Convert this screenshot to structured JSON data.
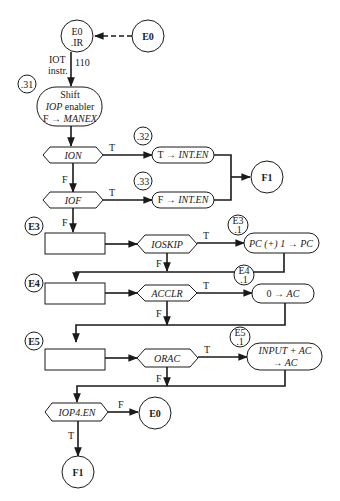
{
  "diagram": {
    "start": {
      "connector_label": "E0",
      "state_line1": "E0",
      "state_line2": ".IR"
    },
    "iot_label": {
      "line1": "IOT",
      "line2": "instr.",
      "code": "110"
    },
    "step31": {
      "tag": ".31",
      "line1": "Shift",
      "line2_italic": "IOP",
      "line2_rest": " enabler",
      "line3_prefix": "F → ",
      "line3_italic": "MANEX"
    },
    "ion": {
      "label": "ION",
      "true_label": "T",
      "false_label": "F",
      "tag": ".32",
      "action_prefix": "T → ",
      "action_italic": "INT.EN"
    },
    "iof": {
      "label": "IOF",
      "true_label": "T",
      "false_label": "F",
      "tag": ".33",
      "action_prefix": "F → ",
      "action_italic": "INT.EN"
    },
    "f1_connector": "F1",
    "e3": {
      "tag": "E3",
      "decision": "IOSKIP",
      "true_label": "T",
      "false_label": "F",
      "sub_tag_line1": "E3",
      "sub_tag_line2": ".1",
      "action": "PC (+) 1 → PC"
    },
    "e4": {
      "tag": "E4",
      "decision": "ACCLR",
      "true_label": "T",
      "false_label": "F",
      "sub_tag_line1": "E4",
      "sub_tag_line2": ".1",
      "action_prefix": "0 → ",
      "action_italic": "AC"
    },
    "e5": {
      "tag": "E5",
      "decision": "ORAC",
      "true_label": "T",
      "false_label": "F",
      "sub_tag_line1": "E5",
      "sub_tag_line2": ".1",
      "action_line1": "INPUT + AC",
      "action_line2": "→ AC"
    },
    "iop4": {
      "decision": "IOP4.EN",
      "false_label": "F",
      "true_label": "T",
      "false_target": "E0",
      "true_target": "F1"
    }
  }
}
